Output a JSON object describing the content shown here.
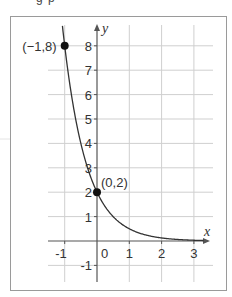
{
  "header_fragment": "g    p",
  "chart_data": {
    "type": "line",
    "title": "",
    "function": "y = 2·(1/4)^x",
    "xlabel": "x",
    "ylabel": "y",
    "xlim": [
      -1.5,
      3.5
    ],
    "ylim": [
      -1.5,
      8.8
    ],
    "grid": true,
    "x_ticks": [
      "-1",
      "0",
      "1",
      "2",
      "3"
    ],
    "y_ticks": [
      "-1",
      "1",
      "2",
      "3",
      "4",
      "5",
      "6",
      "7",
      "8"
    ],
    "series": [
      {
        "name": "exponential decay",
        "x": [
          -1.07,
          -1,
          -0.5,
          0,
          0.5,
          1,
          1.5,
          2,
          2.5,
          3,
          3.3
        ],
        "y": [
          8.8,
          8,
          4,
          2,
          1,
          0.5,
          0.25,
          0.125,
          0.0625,
          0.03125,
          0.02
        ]
      }
    ],
    "annotations": [
      {
        "label": "(−1,8)",
        "x": -1,
        "y": 8
      },
      {
        "label": "(0,2)",
        "x": 0,
        "y": 2
      }
    ]
  },
  "colors": {
    "grid": "#cfcfcf",
    "axis": "#555555",
    "curve": "#333333",
    "frame": "#9a9a9a",
    "point": "#111111"
  }
}
